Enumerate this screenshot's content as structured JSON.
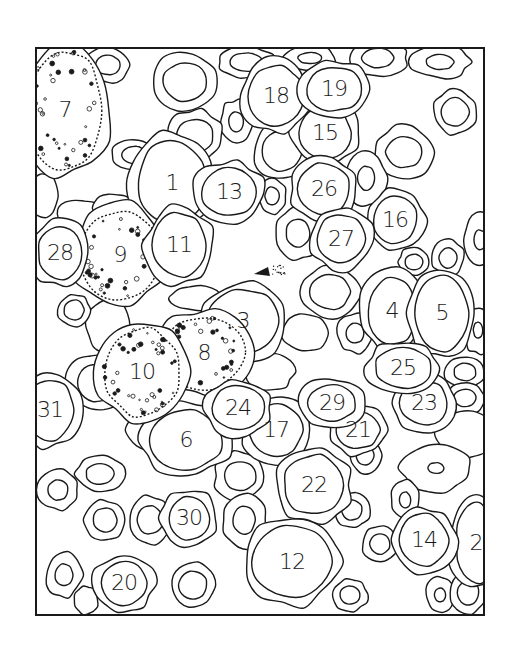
{
  "figure": {
    "type": "cell-illustration",
    "frame": {
      "x": 36,
      "y": 48,
      "width": 448,
      "height": 567
    },
    "line_color": "#1a1a1a",
    "background": "#ffffff"
  },
  "cells": [
    {
      "label": "1",
      "x": 172,
      "y": 183,
      "rx": 34,
      "ry": 42
    },
    {
      "label": "2",
      "x": 476,
      "y": 543,
      "rx": 20,
      "ry": 40
    },
    {
      "label": "3",
      "x": 243,
      "y": 321,
      "rx": 36,
      "ry": 32
    },
    {
      "label": "4",
      "x": 392,
      "y": 311,
      "rx": 24,
      "ry": 34
    },
    {
      "label": "5",
      "x": 442,
      "y": 313,
      "rx": 26,
      "ry": 38
    },
    {
      "label": "6",
      "x": 186,
      "y": 440,
      "rx": 36,
      "ry": 30
    },
    {
      "label": "7",
      "x": 65,
      "y": 110,
      "rx": 38,
      "ry": 60
    },
    {
      "label": "8",
      "x": 204,
      "y": 353,
      "rx": 40,
      "ry": 36
    },
    {
      "label": "9",
      "x": 120,
      "y": 255,
      "rx": 40,
      "ry": 44
    },
    {
      "label": "10",
      "x": 142,
      "y": 372,
      "rx": 38,
      "ry": 44
    },
    {
      "label": "11",
      "x": 179,
      "y": 245,
      "rx": 26,
      "ry": 32
    },
    {
      "label": "12",
      "x": 292,
      "y": 562,
      "rx": 40,
      "ry": 36
    },
    {
      "label": "13",
      "x": 229,
      "y": 192,
      "rx": 28,
      "ry": 24
    },
    {
      "label": "14",
      "x": 424,
      "y": 540,
      "rx": 24,
      "ry": 26
    },
    {
      "label": "15",
      "x": 325,
      "y": 133,
      "rx": 26,
      "ry": 26
    },
    {
      "label": "16",
      "x": 395,
      "y": 220,
      "rx": 22,
      "ry": 24
    },
    {
      "label": "17",
      "x": 276,
      "y": 430,
      "rx": 26,
      "ry": 26
    },
    {
      "label": "18",
      "x": 276,
      "y": 96,
      "rx": 28,
      "ry": 30
    },
    {
      "label": "19",
      "x": 334,
      "y": 89,
      "rx": 28,
      "ry": 22
    },
    {
      "label": "20",
      "x": 124,
      "y": 583,
      "rx": 22,
      "ry": 22
    },
    {
      "label": "21",
      "x": 358,
      "y": 430,
      "rx": 22,
      "ry": 18
    },
    {
      "label": "22",
      "x": 314,
      "y": 485,
      "rx": 30,
      "ry": 30
    },
    {
      "label": "23",
      "x": 424,
      "y": 403,
      "rx": 24,
      "ry": 22
    },
    {
      "label": "24",
      "x": 238,
      "y": 408,
      "rx": 26,
      "ry": 22
    },
    {
      "label": "25",
      "x": 403,
      "y": 368,
      "rx": 28,
      "ry": 20
    },
    {
      "label": "26",
      "x": 324,
      "y": 189,
      "rx": 26,
      "ry": 26
    },
    {
      "label": "27",
      "x": 341,
      "y": 239,
      "rx": 24,
      "ry": 24
    },
    {
      "label": "28",
      "x": 60,
      "y": 253,
      "rx": 22,
      "ry": 26
    },
    {
      "label": "29",
      "x": 332,
      "y": 403,
      "rx": 24,
      "ry": 18
    },
    {
      "label": "30",
      "x": 189,
      "y": 518,
      "rx": 20,
      "ry": 22
    },
    {
      "label": "31",
      "x": 50,
      "y": 410,
      "rx": 24,
      "ry": 30
    }
  ],
  "unlabeled_cells": [
    {
      "x": 185,
      "y": 82,
      "rx": 34,
      "ry": 30,
      "inner": 22
    },
    {
      "x": 108,
      "y": 65,
      "rx": 22,
      "ry": 18,
      "inner": 12
    },
    {
      "x": 246,
      "y": 62,
      "rx": 28,
      "ry": 16,
      "inner": 16
    },
    {
      "x": 378,
      "y": 58,
      "rx": 30,
      "ry": 18,
      "inner": 16
    },
    {
      "x": 455,
      "y": 112,
      "rx": 22,
      "ry": 22,
      "inner": 14
    },
    {
      "x": 404,
      "y": 152,
      "rx": 30,
      "ry": 26,
      "inner": 18
    },
    {
      "x": 236,
      "y": 122,
      "rx": 16,
      "ry": 22,
      "inner": 10
    },
    {
      "x": 195,
      "y": 136,
      "rx": 28,
      "ry": 26,
      "inner": 18
    },
    {
      "x": 282,
      "y": 151,
      "rx": 28,
      "ry": 28,
      "inner": 20
    },
    {
      "x": 134,
      "y": 155,
      "rx": 22,
      "ry": 16,
      "inner": 12
    },
    {
      "x": 366,
      "y": 178,
      "rx": 20,
      "ry": 28,
      "inner": 12
    },
    {
      "x": 272,
      "y": 196,
      "rx": 14,
      "ry": 18,
      "inner": 9
    },
    {
      "x": 298,
      "y": 233,
      "rx": 22,
      "ry": 26,
      "inner": 14
    },
    {
      "x": 330,
      "y": 292,
      "rx": 30,
      "ry": 26,
      "inner": 20
    },
    {
      "x": 414,
      "y": 262,
      "rx": 16,
      "ry": 14,
      "inner": 9
    },
    {
      "x": 448,
      "y": 258,
      "rx": 16,
      "ry": 18,
      "inner": 10
    },
    {
      "x": 480,
      "y": 240,
      "rx": 16,
      "ry": 26,
      "inner": 10
    },
    {
      "x": 478,
      "y": 330,
      "rx": 14,
      "ry": 24,
      "inner": 8
    },
    {
      "x": 465,
      "y": 372,
      "rx": 20,
      "ry": 16,
      "inner": 11
    },
    {
      "x": 465,
      "y": 398,
      "rx": 20,
      "ry": 16,
      "inner": 11
    },
    {
      "x": 466,
      "y": 434,
      "rx": 30,
      "ry": 24,
      "inner": 0
    },
    {
      "x": 436,
      "y": 468,
      "rx": 36,
      "ry": 24,
      "inner": 8
    },
    {
      "x": 97,
      "y": 383,
      "rx": 30,
      "ry": 28,
      "inner": 20
    },
    {
      "x": 153,
      "y": 430,
      "rx": 26,
      "ry": 20,
      "inner": 0
    },
    {
      "x": 100,
      "y": 474,
      "rx": 24,
      "ry": 18,
      "inner": 14
    },
    {
      "x": 58,
      "y": 490,
      "rx": 20,
      "ry": 20,
      "inner": 10
    },
    {
      "x": 105,
      "y": 520,
      "rx": 20,
      "ry": 20,
      "inner": 12
    },
    {
      "x": 150,
      "y": 520,
      "rx": 22,
      "ry": 24,
      "inner": 14
    },
    {
      "x": 240,
      "y": 476,
      "rx": 26,
      "ry": 24,
      "inner": 16
    },
    {
      "x": 244,
      "y": 520,
      "rx": 22,
      "ry": 28,
      "inner": 14
    },
    {
      "x": 352,
      "y": 510,
      "rx": 18,
      "ry": 18,
      "inner": 10
    },
    {
      "x": 365,
      "y": 455,
      "rx": 16,
      "ry": 18,
      "inner": 10
    },
    {
      "x": 380,
      "y": 544,
      "rx": 18,
      "ry": 18,
      "inner": 10
    },
    {
      "x": 405,
      "y": 500,
      "rx": 14,
      "ry": 20,
      "inner": 8
    },
    {
      "x": 193,
      "y": 585,
      "rx": 22,
      "ry": 22,
      "inner": 14
    },
    {
      "x": 64,
      "y": 575,
      "rx": 18,
      "ry": 22,
      "inner": 11
    },
    {
      "x": 86,
      "y": 600,
      "rx": 12,
      "ry": 14,
      "inner": 0
    },
    {
      "x": 350,
      "y": 595,
      "rx": 18,
      "ry": 16,
      "inner": 10
    },
    {
      "x": 440,
      "y": 595,
      "rx": 14,
      "ry": 18,
      "inner": 7
    },
    {
      "x": 468,
      "y": 593,
      "rx": 18,
      "ry": 20,
      "inner": 12
    },
    {
      "x": 305,
      "y": 333,
      "rx": 24,
      "ry": 18,
      "inner": 0
    },
    {
      "x": 355,
      "y": 333,
      "rx": 18,
      "ry": 20,
      "inner": 10
    },
    {
      "x": 270,
      "y": 372,
      "rx": 24,
      "ry": 18,
      "inner": 0
    },
    {
      "x": 195,
      "y": 298,
      "rx": 26,
      "ry": 12,
      "inner": 0
    },
    {
      "x": 108,
      "y": 325,
      "rx": 22,
      "ry": 26,
      "inner": 0
    },
    {
      "x": 74,
      "y": 310,
      "rx": 16,
      "ry": 16,
      "inner": 10
    },
    {
      "x": 80,
      "y": 214,
      "rx": 22,
      "ry": 14,
      "inner": 0
    },
    {
      "x": 113,
      "y": 208,
      "rx": 20,
      "ry": 14,
      "inner": 0
    },
    {
      "x": 44,
      "y": 196,
      "rx": 14,
      "ry": 22,
      "inner": 0
    },
    {
      "x": 440,
      "y": 62,
      "rx": 30,
      "ry": 16,
      "inner": 14
    },
    {
      "x": 310,
      "y": 58,
      "rx": 26,
      "ry": 12,
      "inner": 12
    },
    {
      "x": 62,
      "y": 60,
      "rx": 20,
      "ry": 12,
      "inner": 10
    }
  ],
  "granular_cells": [
    "7",
    "8",
    "9",
    "10"
  ],
  "arrow_marker": {
    "x": 268,
    "y": 272
  }
}
